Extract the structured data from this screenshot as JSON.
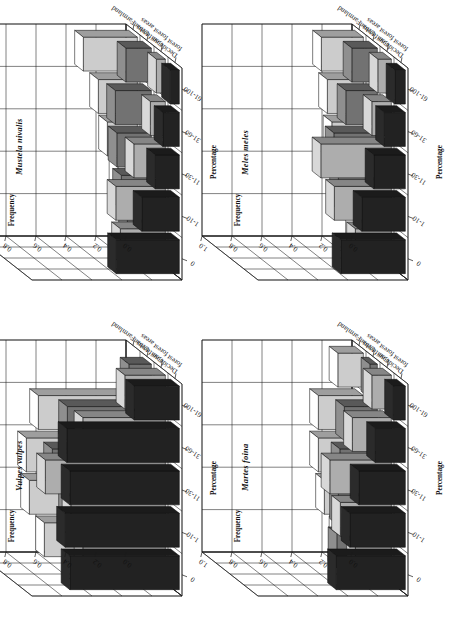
{
  "figure": {
    "panel_layout": "2x2",
    "axis_names": {
      "frequency": "Frequency",
      "percentage": "Percentage"
    },
    "frequency_ticks": [
      "1.0",
      "0.8",
      "0.6",
      "0.4",
      "0.2",
      "0.0"
    ],
    "frequency_tick_values": [
      1.0,
      0.8,
      0.6,
      0.4,
      0.2,
      0.0
    ],
    "percentage_categories": [
      "0",
      "1-10",
      "11-30",
      "31-60",
      "61-100"
    ],
    "habitats": [
      "Deciduous forest",
      "Coniferous forest",
      "Urban areas",
      "Farmland"
    ],
    "habitat_labels": [
      {
        "line1": "Deciduous",
        "line2": "forest"
      },
      {
        "line1": "Coniferous",
        "line2": "forest"
      },
      {
        "line1": "Urban",
        "line2": "areas"
      },
      {
        "line1": "Farmland",
        "line2": ""
      }
    ],
    "habitat_fills": [
      "#2b2b2b",
      "#d8d8d8",
      "#8f8f8f",
      "#ffffff"
    ],
    "rotation_deg": -90
  },
  "chart_data": [
    {
      "type": "bar",
      "title": "Mustela nivalis",
      "xlabel": "Percentage",
      "ylabel": "Frequency",
      "zlabel": "",
      "ylim": [
        0,
        1.0
      ],
      "grid": true,
      "legend": "none",
      "categories": [
        "0",
        "1-10",
        "11-30",
        "31-60",
        "61-100"
      ],
      "series": [
        {
          "name": "Deciduous forest",
          "values": [
            0.42,
            0.25,
            0.16,
            0.11,
            0.06
          ]
        },
        {
          "name": "Coniferous forest",
          "values": [
            0.3,
            0.33,
            0.21,
            0.1,
            0.06
          ]
        },
        {
          "name": "Urban areas",
          "values": [
            0.16,
            0.2,
            0.23,
            0.24,
            0.17
          ]
        },
        {
          "name": "Farmland",
          "values": [
            0.05,
            0.13,
            0.2,
            0.26,
            0.36
          ]
        }
      ]
    },
    {
      "type": "bar",
      "title": "Meles meles",
      "xlabel": "Percentage",
      "ylabel": "Frequency",
      "zlabel": "",
      "ylim": [
        0,
        1.0
      ],
      "grid": true,
      "legend": "none",
      "categories": [
        "0",
        "1-10",
        "11-30",
        "31-60",
        "61-100"
      ],
      "series": [
        {
          "name": "Deciduous forest",
          "values": [
            0.43,
            0.29,
            0.21,
            0.14,
            0.07
          ]
        },
        {
          "name": "Coniferous forest",
          "values": [
            0.24,
            0.38,
            0.47,
            0.13,
            0.09
          ]
        },
        {
          "name": "Urban areas",
          "values": [
            0.09,
            0.26,
            0.29,
            0.21,
            0.17
          ]
        },
        {
          "name": "Farmland",
          "values": [
            0.06,
            0.16,
            0.21,
            0.24,
            0.28
          ]
        }
      ]
    },
    {
      "type": "bar",
      "title": "Vulpes vulpes",
      "xlabel": "Percentage",
      "ylabel": "Frequency",
      "zlabel": "",
      "ylim": [
        0,
        1.0
      ],
      "grid": true,
      "legend": "none",
      "categories": [
        "0",
        "1-10",
        "11-30",
        "31-60",
        "61-100"
      ],
      "series": [
        {
          "name": "Deciduous forest",
          "values": [
            0.73,
            0.76,
            0.73,
            0.75,
            0.3
          ]
        },
        {
          "name": "Coniferous forest",
          "values": [
            0.55,
            0.63,
            0.8,
            0.55,
            0.27
          ]
        },
        {
          "name": "Urban areas",
          "values": [
            0.37,
            0.56,
            0.66,
            0.56,
            0.15
          ]
        },
        {
          "name": "Farmland",
          "values": [
            0.62,
            0.72,
            0.74,
            0.66,
            0.0
          ]
        }
      ]
    },
    {
      "type": "bar",
      "title": "Martes foina",
      "xlabel": "Percentage",
      "ylabel": "Frequency",
      "zlabel": "",
      "ylim": [
        0,
        1.0
      ],
      "grid": true,
      "legend": "none",
      "categories": [
        "0",
        "1-10",
        "11-30",
        "31-60",
        "61-100"
      ],
      "series": [
        {
          "name": "Deciduous forest",
          "values": [
            0.46,
            0.37,
            0.31,
            0.2,
            0.08
          ]
        },
        {
          "name": "Coniferous forest",
          "values": [
            0.24,
            0.34,
            0.41,
            0.26,
            0.13
          ]
        },
        {
          "name": "Urban areas",
          "values": [
            0.27,
            0.26,
            0.25,
            0.22,
            0.05
          ]
        },
        {
          "name": "Farmland",
          "values": [
            0.17,
            0.26,
            0.3,
            0.3,
            0.17
          ]
        }
      ]
    }
  ],
  "panels": [
    {
      "id": "mustela-nivalis",
      "index": 0,
      "pos": {
        "left": 0,
        "top": 0
      }
    },
    {
      "id": "meles-meles",
      "index": 1,
      "pos": {
        "left": 226,
        "top": 0
      }
    },
    {
      "id": "vulpes-vulpes",
      "index": 2,
      "pos": {
        "left": 0,
        "top": 316
      }
    },
    {
      "id": "martes-foina",
      "index": 3,
      "pos": {
        "left": 226,
        "top": 316
      }
    }
  ]
}
